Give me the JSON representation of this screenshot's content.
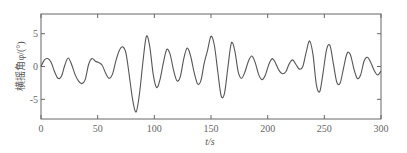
{
  "chart_data": {
    "type": "line",
    "title": "",
    "xlabel": "t/s",
    "ylabel": "横摇角φ/(°)",
    "xlim": [
      0,
      300
    ],
    "ylim": [
      -8,
      8
    ],
    "xticks": [
      0,
      50,
      100,
      150,
      200,
      250,
      300
    ],
    "yticks": [
      -5,
      0,
      5
    ],
    "grid": false,
    "legend": null,
    "series": [
      {
        "name": "roll angle",
        "color": "#555555",
        "x": [
          0,
          3,
          6,
          9,
          12,
          15,
          18,
          21,
          24,
          27,
          30,
          33,
          36,
          39,
          42,
          45,
          48,
          51,
          54,
          57,
          60,
          63,
          66,
          69,
          72,
          75,
          78,
          81,
          84,
          87,
          90,
          93,
          96,
          99,
          102,
          105,
          108,
          111,
          114,
          117,
          120,
          123,
          126,
          129,
          132,
          135,
          138,
          141,
          144,
          147,
          150,
          153,
          156,
          159,
          162,
          165,
          168,
          171,
          174,
          177,
          180,
          183,
          186,
          189,
          192,
          195,
          198,
          201,
          204,
          207,
          210,
          213,
          216,
          219,
          222,
          225,
          228,
          231,
          234,
          237,
          240,
          243,
          246,
          249,
          252,
          255,
          258,
          261,
          264,
          267,
          270,
          273,
          276,
          279,
          282,
          285,
          288,
          291,
          294,
          297,
          300
        ],
        "y": [
          0.0,
          1.0,
          1.2,
          0.6,
          -0.8,
          -1.8,
          -1.5,
          0.2,
          1.3,
          0.3,
          -1.2,
          -2.2,
          -2.6,
          -2.0,
          0.3,
          1.2,
          0.8,
          0.6,
          0.2,
          -1.0,
          -1.8,
          -1.2,
          0.8,
          2.4,
          3.0,
          2.0,
          -1.5,
          -5.2,
          -6.9,
          -4.0,
          0.8,
          4.6,
          3.0,
          -1.2,
          -3.2,
          -2.0,
          0.6,
          2.6,
          1.8,
          -0.6,
          -2.2,
          -1.5,
          1.2,
          2.8,
          1.6,
          -0.8,
          -2.6,
          -2.2,
          0.5,
          2.5,
          4.6,
          3.2,
          -0.8,
          -4.5,
          -4.0,
          0.0,
          3.6,
          2.4,
          -0.8,
          -1.8,
          -0.8,
          0.8,
          1.6,
          0.6,
          -1.2,
          -2.0,
          -1.3,
          0.3,
          1.2,
          0.5,
          -0.6,
          -1.1,
          -0.8,
          0.4,
          1.0,
          0.3,
          -0.4,
          0.0,
          2.2,
          3.9,
          1.8,
          -2.8,
          -3.8,
          -0.8,
          2.6,
          3.2,
          0.4,
          -2.4,
          -2.5,
          -0.2,
          2.0,
          1.8,
          -0.3,
          -1.8,
          -1.3,
          0.8,
          1.4,
          0.6,
          -0.6,
          -1.3,
          -0.7
        ]
      }
    ]
  }
}
